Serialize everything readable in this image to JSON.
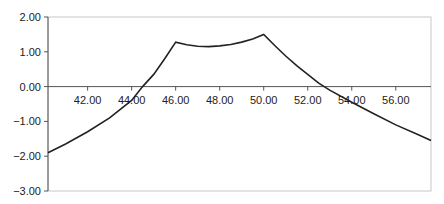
{
  "chart_data": {
    "type": "line",
    "title": "",
    "xlabel": "",
    "ylabel": "",
    "xlim": [
      40.2,
      57.6
    ],
    "ylim": [
      -3.0,
      2.0
    ],
    "grid": false,
    "legend": null,
    "x_ticks": [
      "42.00",
      "44.00",
      "46.00",
      "48.00",
      "50.00",
      "52.00",
      "54.00",
      "56.00"
    ],
    "y_ticks": [
      "2.00",
      "1.00",
      "0.00",
      "-1.00",
      "-2.00",
      "-3.00"
    ],
    "series": [
      {
        "name": "curve",
        "x": [
          40.2,
          41.0,
          42.0,
          43.0,
          44.0,
          44.5,
          45.0,
          45.5,
          46.0,
          46.5,
          47.0,
          47.5,
          48.0,
          48.5,
          49.0,
          49.5,
          50.0,
          50.5,
          51.0,
          51.5,
          52.0,
          52.5,
          53.0,
          54.0,
          55.0,
          56.0,
          57.0,
          57.6
        ],
        "y": [
          -1.9,
          -1.65,
          -1.3,
          -0.9,
          -0.4,
          0.0,
          0.35,
          0.8,
          1.28,
          1.2,
          1.16,
          1.15,
          1.17,
          1.21,
          1.28,
          1.37,
          1.5,
          1.18,
          0.88,
          0.6,
          0.35,
          0.1,
          -0.1,
          -0.45,
          -0.78,
          -1.1,
          -1.38,
          -1.55
        ]
      }
    ]
  }
}
